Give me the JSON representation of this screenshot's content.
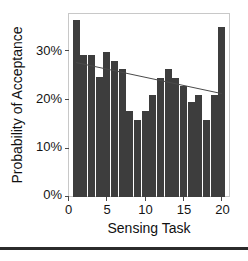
{
  "chart_data": {
    "type": "bar",
    "title": "",
    "subtitle": "",
    "xlabel": "Sensing Task",
    "ylabel": "Probability of Acceptance",
    "categories": [
      1,
      2,
      3,
      4,
      5,
      6,
      7,
      8,
      9,
      10,
      11,
      12,
      13,
      14,
      15,
      16,
      17,
      18,
      19,
      20
    ],
    "values": [
      36.3,
      29.2,
      29.2,
      24.6,
      29.8,
      28.0,
      26.2,
      17.6,
      15.8,
      17.6,
      21.0,
      24.5,
      26.3,
      24.5,
      22.8,
      19.4,
      21.0,
      15.8,
      21.0,
      35.0
    ],
    "x": [
      1,
      2,
      3,
      4,
      5,
      6,
      7,
      8,
      9,
      10,
      11,
      12,
      13,
      14,
      15,
      16,
      17,
      18,
      19,
      20
    ],
    "xlim": [
      0,
      21
    ],
    "ylim": [
      0,
      38
    ],
    "xticks": [
      0,
      5,
      10,
      15,
      20
    ],
    "xtick_labels": [
      "0",
      "5",
      "10",
      "15",
      "20"
    ],
    "yticks": [
      0,
      10,
      20,
      30
    ],
    "ytick_labels": [
      "0%",
      "10%",
      "20%",
      "30%"
    ],
    "grid": false,
    "legend": "none",
    "series": [
      {
        "name": "Probability of Acceptance",
        "type": "bar",
        "color": "#3d3d3d",
        "values": [
          36.3,
          29.2,
          29.2,
          24.6,
          29.8,
          28.0,
          26.2,
          17.6,
          15.8,
          17.6,
          21.0,
          24.5,
          26.3,
          24.5,
          22.8,
          19.4,
          21.0,
          15.8,
          21.0,
          35.0
        ]
      },
      {
        "name": "Trend",
        "type": "line",
        "color": "#4a4a4a",
        "x": [
          1,
          20
        ],
        "values": [
          27.6,
          21.2
        ]
      }
    ],
    "annotations": []
  },
  "figure": {
    "bar_color": "#3d3d3d",
    "line_color": "#4a4a4a",
    "frame_color": "#c8c8c8",
    "text_color": "#141414",
    "background": "#ffffff",
    "footer_rule_color": "#2b2b2b"
  },
  "labels": {
    "y_axis_title": "Probability of Acceptance",
    "x_axis_title": "Sensing Task",
    "y_tick_0": "0%",
    "y_tick_1": "10%",
    "y_tick_2": "20%",
    "y_tick_3": "30%",
    "x_tick_0": "0",
    "x_tick_1": "5",
    "x_tick_2": "10",
    "x_tick_3": "15",
    "x_tick_4": "20"
  }
}
